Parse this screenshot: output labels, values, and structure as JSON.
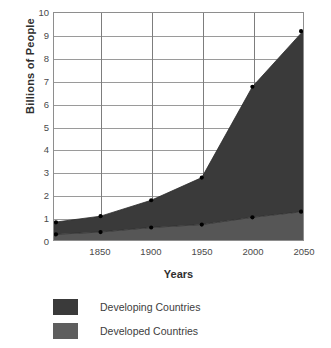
{
  "chart": {
    "y_axis_title": "Billions of People",
    "x_axis_title": "Years",
    "y_ticks": [
      "0",
      "1",
      "2",
      "3",
      "4",
      "5",
      "6",
      "7",
      "8",
      "9",
      "10"
    ],
    "x_ticks": [
      "1850",
      "1900",
      "1950",
      "2000",
      "2050"
    ]
  },
  "legend": {
    "items": [
      {
        "label": "Developing Countries",
        "color": "#3a3a3a"
      },
      {
        "label": "Developed Countries",
        "color": "#5e5e5e"
      }
    ]
  },
  "colors": {
    "developing_fill": "#3a3a3a",
    "developed_fill": "#565656",
    "gridline": "#9a9a9a",
    "axis": "#8e8e8e",
    "marker": "#000000",
    "text": "#3d3d3d",
    "background": "#ffffff"
  },
  "chart_data": {
    "type": "area",
    "title": "",
    "subtitle": "",
    "xlabel": "Years",
    "ylabel": "Billions of People",
    "xlim": [
      1804,
      2050
    ],
    "ylim": [
      0,
      10
    ],
    "grid": true,
    "stacked": true,
    "legend_position": "bottom-left",
    "x": [
      1804,
      1850,
      1900,
      1950,
      2000,
      2050
    ],
    "x_tick_values": [
      1850,
      1900,
      1950,
      2000,
      2050
    ],
    "y_tick_values": [
      0,
      1,
      2,
      3,
      4,
      5,
      6,
      7,
      8,
      9,
      10
    ],
    "series": [
      {
        "name": "Developed Countries",
        "color": "#565656",
        "values": [
          0.25,
          0.35,
          0.55,
          0.68,
          1.0,
          1.25
        ]
      },
      {
        "name": "Developing Countries",
        "color": "#3a3a3a",
        "values": [
          0.53,
          0.7,
          1.2,
          2.07,
          5.75,
          7.95
        ]
      }
    ],
    "totals": [
      0.78,
      1.05,
      1.75,
      2.75,
      6.75,
      9.2
    ],
    "markers": {
      "total_points": [
        0.78,
        1.05,
        1.75,
        2.75,
        6.75,
        9.2
      ],
      "developed_points": [
        0.25,
        0.35,
        0.55,
        0.68,
        1.0,
        1.25
      ]
    }
  }
}
